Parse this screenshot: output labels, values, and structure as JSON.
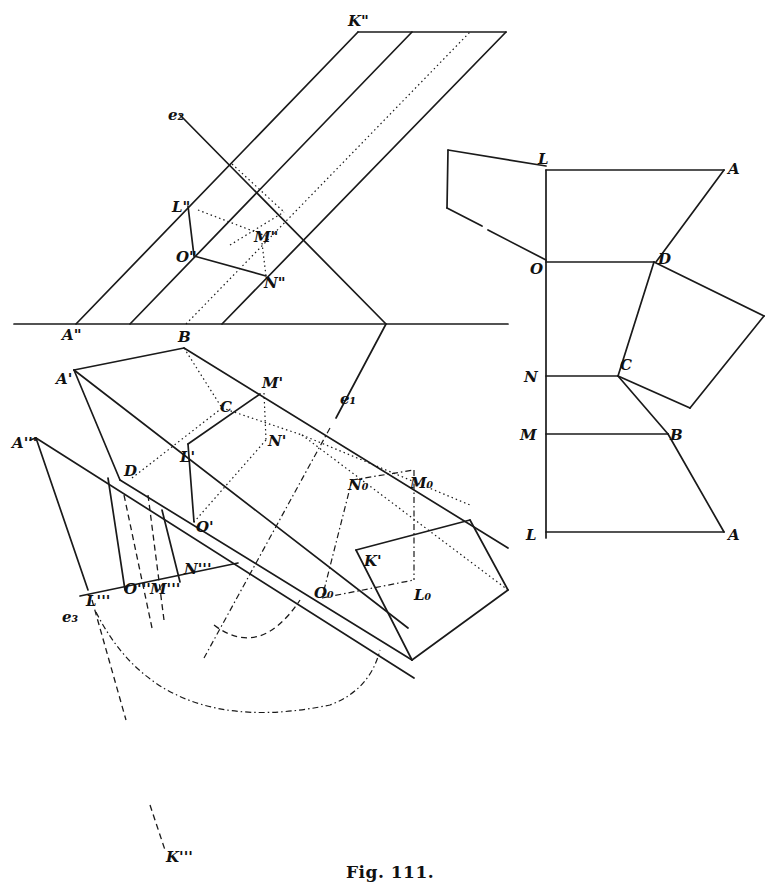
{
  "figure": {
    "caption": "Fig. 111.",
    "stroke_color": "#1a1a1a",
    "background": "#ffffff"
  },
  "diagram": {
    "elevation_view": {
      "ground_line": [
        [
          14,
          324
        ],
        [
          508,
          324
        ]
      ],
      "solid_lines": [
        [
          [
            76,
            324
          ],
          [
            358,
            32
          ]
        ],
        [
          [
            130,
            324
          ],
          [
            412,
            32
          ]
        ],
        [
          [
            222,
            324
          ],
          [
            506,
            32
          ]
        ],
        [
          [
            358,
            32
          ],
          [
            506,
            32
          ]
        ],
        [
          [
            180,
            115
          ],
          [
            386,
            324
          ]
        ],
        [
          [
            386,
            324
          ],
          [
            336,
            418
          ]
        ],
        [
          [
            188,
            206
          ],
          [
            194,
            256
          ]
        ],
        [
          [
            194,
            256
          ],
          [
            266,
            276
          ]
        ]
      ],
      "dotted_lines": [
        [
          [
            186,
            324
          ],
          [
            470,
            32
          ]
        ],
        [
          [
            230,
            245
          ],
          [
            284,
            212
          ]
        ],
        [
          [
            198,
            210
          ],
          [
            266,
            236
          ]
        ],
        [
          [
            262,
            243
          ],
          [
            266,
            276
          ]
        ],
        [
          [
            232,
            164
          ],
          [
            284,
            212
          ]
        ]
      ],
      "labels": [
        {
          "text": "K\"",
          "x": 348,
          "y": 26
        },
        {
          "text": "e₂",
          "x": 168,
          "y": 120
        },
        {
          "text": "L\"",
          "x": 172,
          "y": 212
        },
        {
          "text": "O\"",
          "x": 176,
          "y": 262
        },
        {
          "text": "M\"",
          "x": 254,
          "y": 242
        },
        {
          "text": "N\"",
          "x": 264,
          "y": 288
        },
        {
          "text": "A\"",
          "x": 62,
          "y": 340
        }
      ]
    },
    "plan_view": {
      "solid_lines": [
        [
          [
            74,
            370
          ],
          [
            184,
            348
          ]
        ],
        [
          [
            184,
            348
          ],
          [
            508,
            548
          ]
        ],
        [
          [
            74,
            370
          ],
          [
            408,
            628
          ]
        ],
        [
          [
            74,
            370
          ],
          [
            120,
            480
          ]
        ],
        [
          [
            120,
            480
          ],
          [
            412,
            660
          ]
        ],
        [
          [
            260,
            394
          ],
          [
            188,
            444
          ]
        ],
        [
          [
            188,
            444
          ],
          [
            194,
            522
          ]
        ],
        [
          [
            356,
            550
          ],
          [
            470,
            520
          ]
        ],
        [
          [
            470,
            520
          ],
          [
            508,
            590
          ]
        ],
        [
          [
            356,
            550
          ],
          [
            412,
            660
          ]
        ],
        [
          [
            412,
            660
          ],
          [
            508,
            590
          ]
        ],
        [
          [
            36,
            438
          ],
          [
            30,
            440
          ]
        ],
        [
          [
            36,
            438
          ],
          [
            88,
            590
          ]
        ],
        [
          [
            36,
            438
          ],
          [
            414,
            678
          ]
        ],
        [
          [
            80,
            596
          ],
          [
            238,
            563
          ]
        ],
        [
          [
            108,
            478
          ],
          [
            125,
            590
          ]
        ],
        [
          [
            162,
            510
          ],
          [
            180,
            582
          ]
        ]
      ],
      "dotted_lines": [
        [
          [
            184,
            348
          ],
          [
            222,
            408
          ]
        ],
        [
          [
            132,
            478
          ],
          [
            222,
            408
          ]
        ],
        [
          [
            222,
            408
          ],
          [
            302,
            435
          ]
        ],
        [
          [
            302,
            435
          ],
          [
            470,
            505
          ]
        ],
        [
          [
            264,
            393
          ],
          [
            266,
            440
          ]
        ],
        [
          [
            266,
            440
          ],
          [
            194,
            522
          ]
        ],
        [
          [
            302,
            435
          ],
          [
            508,
            590
          ]
        ]
      ],
      "dashdot_lines": [
        [
          [
            352,
            480
          ],
          [
            414,
            470
          ]
        ],
        [
          [
            414,
            470
          ],
          [
            414,
            580
          ]
        ],
        [
          [
            322,
            598
          ],
          [
            414,
            580
          ]
        ],
        [
          [
            352,
            480
          ],
          [
            322,
            598
          ]
        ],
        [
          [
            330,
            428
          ],
          [
            204,
            658
          ]
        ]
      ],
      "dashed_lines": [
        [
          [
            124,
            495
          ],
          [
            152,
            628
          ]
        ],
        [
          [
            148,
            495
          ],
          [
            164,
            620
          ]
        ],
        [
          [
            92,
            600
          ],
          [
            126,
            720
          ]
        ],
        [
          [
            150,
            805
          ],
          [
            165,
            850
          ]
        ]
      ],
      "arcs": [
        {
          "d": "M 214 625 Q 260 660 300 600",
          "style": "dash"
        },
        {
          "d": "M 96 612 Q 160 740 330 705 Q 370 690 380 650",
          "style": "dashdot"
        }
      ],
      "labels": [
        {
          "text": "B",
          "x": 178,
          "y": 342
        },
        {
          "text": "A'",
          "x": 56,
          "y": 384
        },
        {
          "text": "M'",
          "x": 262,
          "y": 388
        },
        {
          "text": "C",
          "x": 220,
          "y": 412
        },
        {
          "text": "N'",
          "x": 268,
          "y": 446
        },
        {
          "text": "A'''",
          "x": 12,
          "y": 448
        },
        {
          "text": "L'",
          "x": 180,
          "y": 462
        },
        {
          "text": "D",
          "x": 124,
          "y": 476
        },
        {
          "text": "e₁",
          "x": 340,
          "y": 404
        },
        {
          "text": "N₀",
          "x": 348,
          "y": 490
        },
        {
          "text": "M₀",
          "x": 410,
          "y": 488
        },
        {
          "text": "O'",
          "x": 196,
          "y": 532
        },
        {
          "text": "K'",
          "x": 364,
          "y": 566
        },
        {
          "text": "N'''",
          "x": 184,
          "y": 574
        },
        {
          "text": "O'''",
          "x": 124,
          "y": 594
        },
        {
          "text": "M'''",
          "x": 150,
          "y": 594
        },
        {
          "text": "L'''",
          "x": 86,
          "y": 606
        },
        {
          "text": "O₀",
          "x": 314,
          "y": 598
        },
        {
          "text": "L₀",
          "x": 414,
          "y": 600
        },
        {
          "text": "e₃",
          "x": 62,
          "y": 622
        },
        {
          "text": "K'''",
          "x": 166,
          "y": 862
        }
      ]
    },
    "development_view": {
      "solid_lines": [
        [
          [
            546,
            170
          ],
          [
            546,
            538
          ]
        ],
        [
          [
            546,
            170
          ],
          [
            724,
            170
          ]
        ],
        [
          [
            724,
            170
          ],
          [
            656,
            262
          ]
        ],
        [
          [
            546,
            262
          ],
          [
            654,
            262
          ]
        ],
        [
          [
            546,
            376
          ],
          [
            618,
            376
          ]
        ],
        [
          [
            546,
            434
          ],
          [
            668,
            434
          ]
        ],
        [
          [
            546,
            532
          ],
          [
            724,
            532
          ]
        ],
        [
          [
            668,
            434
          ],
          [
            724,
            532
          ]
        ],
        [
          [
            618,
            376
          ],
          [
            668,
            434
          ]
        ],
        [
          [
            654,
            262
          ],
          [
            618,
            376
          ]
        ],
        [
          [
            654,
            262
          ],
          [
            764,
            316
          ]
        ],
        [
          [
            764,
            316
          ],
          [
            690,
            408
          ]
        ],
        [
          [
            690,
            408
          ],
          [
            618,
            376
          ]
        ],
        [
          [
            546,
            166
          ],
          [
            448,
            150
          ]
        ],
        [
          [
            448,
            150
          ],
          [
            447,
            208
          ]
        ],
        [
          [
            447,
            208
          ],
          [
            482,
            226
          ]
        ],
        [
          [
            488,
            230
          ],
          [
            546,
            260
          ]
        ]
      ],
      "labels": [
        {
          "text": "L",
          "x": 538,
          "y": 164
        },
        {
          "text": "A",
          "x": 728,
          "y": 174
        },
        {
          "text": "O",
          "x": 530,
          "y": 274
        },
        {
          "text": "D",
          "x": 658,
          "y": 264
        },
        {
          "text": "N",
          "x": 524,
          "y": 382
        },
        {
          "text": "C",
          "x": 620,
          "y": 370
        },
        {
          "text": "M",
          "x": 520,
          "y": 440
        },
        {
          "text": "B",
          "x": 670,
          "y": 440
        },
        {
          "text": "L",
          "x": 526,
          "y": 540
        },
        {
          "text": "A",
          "x": 728,
          "y": 540
        }
      ]
    }
  }
}
